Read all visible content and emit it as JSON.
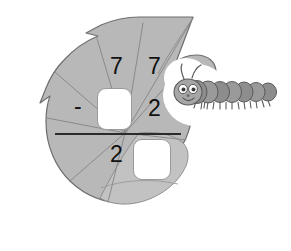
{
  "scene": {
    "title": "Leaf subtraction problem with caterpillar",
    "background_color": "#ffffff"
  },
  "colors": {
    "leaf_fill": "#b8b8b8",
    "leaf_fill_dark": "#aaaaaa",
    "leaf_fill_light": "#c2c2c2",
    "leaf_outline": "#6f6f6f",
    "vein": "#8a8a8a",
    "caterpillar_body": "#9a9a9a",
    "caterpillar_body_dark": "#808080",
    "caterpillar_outline": "#5a5a5a",
    "caterpillar_head": "#a6a6a6",
    "eye_white": "#ffffff",
    "pupil": "#3a3a3a",
    "halo": "#ffffff",
    "digit_color": "#111111",
    "rule_color": "#2b2b2b",
    "box_fill": "#ffffff",
    "box_border": "#9a9a9a"
  },
  "problem": {
    "type": "vertical-subtraction",
    "minuend_tens": "7",
    "minuend_ones": "7",
    "operator": "-",
    "subtrahend_ones": "2",
    "difference_tens": "2",
    "answer_box_top_value": "",
    "answer_box_bottom_value": "",
    "answer_box_top_placeholder": "",
    "answer_box_bottom_placeholder": ""
  },
  "illustration": {
    "leaf": {
      "name": "leaf",
      "bites": [
        "top-notch",
        "left-notch",
        "bottom-right-notch",
        "caterpillar-bite"
      ],
      "vein_count": 7
    },
    "caterpillar": {
      "name": "caterpillar",
      "segment_count": 8,
      "antenna_count": 2,
      "eye_count": 2,
      "has_smile": true,
      "leg_count": 14
    }
  }
}
